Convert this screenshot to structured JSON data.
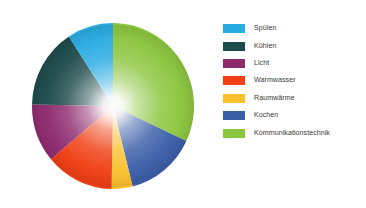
{
  "chart_data": {
    "type": "pie",
    "title": "",
    "legend_position": "right",
    "categories": [
      "Spülen",
      "Kühlen",
      "Licht",
      "Warmwasser",
      "Raumwärme",
      "Kochen",
      "Kommunikationstechnik"
    ],
    "values": [
      9,
      16,
      11,
      14,
      18,
      14,
      18
    ],
    "colors": [
      "#29ABE2",
      "#1D4A4A",
      "#8E2A6E",
      "#F03E13",
      "#FBC02D",
      "#3B5EA8",
      "#8CC63F"
    ],
    "slices": [
      {
        "label": "Kommunikationstechnik",
        "color": "#8CC63F",
        "start_angle": 0,
        "end_angle": 115,
        "percent": 32
      },
      {
        "label": "Kochen",
        "color": "#3B5EA8",
        "start_angle": 115,
        "end_angle": 166,
        "percent": 14
      },
      {
        "label": "Raumwärme",
        "color": "#FBC02D",
        "start_angle": 166,
        "end_angle": 181,
        "percent": 4
      },
      {
        "label": "Warmwasser",
        "color": "#F03E13",
        "start_angle": 181,
        "end_angle": 230,
        "percent": 14
      },
      {
        "label": "Licht",
        "color": "#8E2A6E",
        "start_angle": 230,
        "end_angle": 271,
        "percent": 11
      },
      {
        "label": "Kühlen",
        "color": "#1D4A4A",
        "start_angle": 271,
        "end_angle": 327,
        "percent": 16
      },
      {
        "label": "Spülen",
        "color": "#29ABE2",
        "start_angle": 327,
        "end_angle": 360,
        "percent": 9
      }
    ]
  },
  "legend": {
    "items": [
      {
        "label": "Spülen",
        "color": "#29ABE2"
      },
      {
        "label": "Kühlen",
        "color": "#1D4A4A"
      },
      {
        "label": "Licht",
        "color": "#8E2A6E"
      },
      {
        "label": "Warmwasser",
        "color": "#F03E13"
      },
      {
        "label": "Raumwärme",
        "color": "#FBC02D"
      },
      {
        "label": "Kochen",
        "color": "#3B5EA8"
      },
      {
        "label": "Kommunikationstechnik",
        "color": "#8CC63F"
      }
    ]
  }
}
